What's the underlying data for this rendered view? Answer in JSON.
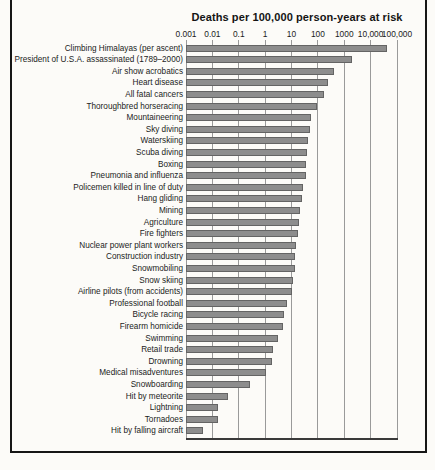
{
  "chart_data": {
    "type": "bar",
    "orientation": "horizontal",
    "x_scale": "log",
    "title": "Deaths per 100,000 person-years at risk",
    "xlim": [
      0.001,
      100000
    ],
    "grid": true,
    "bar_color": "#8d8d8d",
    "x_ticks": [
      {
        "label": "0.001",
        "value": 0.001
      },
      {
        "label": "0.01",
        "value": 0.01
      },
      {
        "label": "0.1",
        "value": 0.1
      },
      {
        "label": "1",
        "value": 1
      },
      {
        "label": "10",
        "value": 10
      },
      {
        "label": "100",
        "value": 100
      },
      {
        "label": "1000",
        "value": 1000
      },
      {
        "label": "10,000",
        "value": 10000
      },
      {
        "label": "100,000",
        "value": 100000
      }
    ],
    "categories": [
      "Climbing Himalayas (per ascent)",
      "President of U.S.A. assassinated (1789–2000)",
      "Air show acrobatics",
      "Heart disease",
      "All fatal cancers",
      "Thoroughbred horseracing",
      "Mountaineering",
      "Sky diving",
      "Waterskiing",
      "Scuba diving",
      "Boxing",
      "Pneumonia and influenza",
      "Policemen killed in line of duty",
      "Hang gliding",
      "Mining",
      "Agriculture",
      "Fire fighters",
      "Nuclear power plant workers",
      "Construction industry",
      "Snowmobiling",
      "Snow skiing",
      "Airline pilots (from accidents)",
      "Professional football",
      "Bicycle racing",
      "Firearm homicide",
      "Swimming",
      "Retail trade",
      "Drowning",
      "Medical misadventures",
      "Snowboarding",
      "Hit by meteorite",
      "Lightning",
      "Tornadoes",
      "Hit by falling aircraft"
    ],
    "values": [
      40000,
      2000,
      400,
      250,
      170,
      90,
      55,
      50,
      42,
      38,
      37,
      34,
      28,
      24,
      21,
      20,
      17,
      15,
      14,
      13,
      11,
      10,
      7,
      5.2,
      4.8,
      3,
      2,
      1.9,
      1.1,
      0.27,
      0.04,
      0.017,
      0.016,
      0.0045
    ]
  }
}
